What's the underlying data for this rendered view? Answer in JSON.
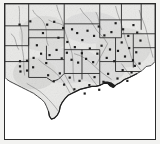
{
  "figure": {
    "type": "map",
    "title": "",
    "caption": "",
    "region": "South-central United States",
    "projection_note": "",
    "background_color": "#f2f2f0",
    "frame_color": "#2b2b2b",
    "land_fill": "#e9e9e7",
    "land_fill_shade": "#d6d6d4",
    "water_fill": "#ffffff",
    "state_border_color": "#2b2b2b",
    "river_color": "#8c8c8c",
    "marker_color": "#1e1e1e",
    "marker_shape": "square",
    "marker_size_px": 2.2,
    "marker_count": 74
  },
  "legend": {
    "visible": false,
    "entries": []
  },
  "axes": {
    "visible": false,
    "x_ticks": [],
    "y_ticks": []
  },
  "chart_data": {
    "type": "scatter",
    "title": "",
    "xlabel": "",
    "ylabel": "",
    "xlim": [
      0,
      160
    ],
    "ylim": [
      0,
      144
    ],
    "grid": false,
    "legend_position": "none",
    "annotations": [],
    "series": [
      {
        "name": "stations",
        "marker": "square",
        "color": "#1e1e1e",
        "points": [
          [
            15.5,
            22.0
          ],
          [
            27.0,
            18.5
          ],
          [
            40.5,
            31.0
          ],
          [
            45.0,
            22.0
          ],
          [
            52.5,
            19.0
          ],
          [
            57.0,
            36.0
          ],
          [
            62.0,
            25.5
          ],
          [
            66.5,
            40.5
          ],
          [
            34.0,
            44.0
          ],
          [
            38.5,
            53.0
          ],
          [
            30.5,
            57.5
          ],
          [
            23.5,
            60.5
          ],
          [
            16.0,
            61.0
          ],
          [
            16.0,
            66.5
          ],
          [
            16.5,
            72.0
          ],
          [
            23.5,
            71.0
          ],
          [
            30.0,
            67.5
          ],
          [
            44.0,
            63.0
          ],
          [
            47.5,
            54.5
          ],
          [
            55.0,
            49.0
          ],
          [
            60.5,
            58.0
          ],
          [
            66.0,
            52.0
          ],
          [
            71.0,
            59.5
          ],
          [
            74.5,
            46.0
          ],
          [
            78.0,
            62.5
          ],
          [
            82.0,
            52.5
          ],
          [
            86.5,
            58.5
          ],
          [
            90.5,
            47.5
          ],
          [
            94.0,
            62.0
          ],
          [
            98.5,
            53.0
          ],
          [
            103.0,
            44.5
          ],
          [
            108.5,
            57.5
          ],
          [
            112.0,
            48.5
          ],
          [
            116.5,
            61.0
          ],
          [
            120.5,
            50.0
          ],
          [
            124.5,
            41.0
          ],
          [
            128.0,
            56.0
          ],
          [
            132.5,
            47.0
          ],
          [
            136.5,
            60.0
          ],
          [
            140.0,
            51.5
          ],
          [
            143.5,
            63.5
          ],
          [
            126.0,
            27.0
          ],
          [
            131.5,
            34.0
          ],
          [
            137.0,
            22.5
          ],
          [
            141.0,
            30.5
          ],
          [
            144.5,
            39.0
          ],
          [
            113.5,
            30.0
          ],
          [
            118.0,
            20.5
          ],
          [
            106.0,
            33.5
          ],
          [
            100.0,
            24.0
          ],
          [
            95.0,
            34.0
          ],
          [
            88.0,
            28.5
          ],
          [
            82.5,
            38.5
          ],
          [
            77.0,
            31.0
          ],
          [
            71.5,
            27.0
          ],
          [
            46.0,
            76.0
          ],
          [
            52.0,
            82.5
          ],
          [
            58.5,
            74.0
          ],
          [
            63.0,
            86.0
          ],
          [
            69.0,
            78.5
          ],
          [
            74.0,
            91.0
          ],
          [
            79.5,
            82.0
          ],
          [
            85.0,
            95.5
          ],
          [
            90.0,
            86.5
          ],
          [
            95.5,
            78.0
          ],
          [
            100.5,
            91.5
          ],
          [
            105.0,
            83.0
          ],
          [
            110.0,
            74.5
          ],
          [
            115.0,
            88.0
          ],
          [
            120.0,
            79.5
          ],
          [
            125.5,
            70.5
          ],
          [
            130.5,
            82.0
          ],
          [
            135.0,
            73.0
          ],
          [
            138.5,
            66.0
          ]
        ]
      }
    ]
  },
  "geography": {
    "states_outlined": [
      "Colorado",
      "Kansas",
      "Missouri",
      "Illinois",
      "Kentucky",
      "Tennessee",
      "New Mexico",
      "Oklahoma",
      "Arkansas",
      "Mississippi",
      "Alabama",
      "Georgia",
      "Texas",
      "Louisiana",
      "Florida"
    ],
    "water_bodies": [
      "Gulf of Mexico",
      "Atlantic Ocean"
    ],
    "rivers_shown": true
  }
}
